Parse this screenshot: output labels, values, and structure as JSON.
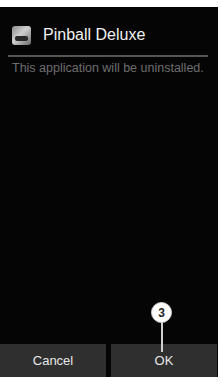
{
  "dialog": {
    "app_name": "Pinball Deluxe",
    "app_icon": "pinball-deluxe-app-icon",
    "message": "This application will be uninstalled."
  },
  "buttons": {
    "cancel_label": "Cancel",
    "ok_label": "OK"
  },
  "annotation": {
    "callout_number": "3"
  }
}
